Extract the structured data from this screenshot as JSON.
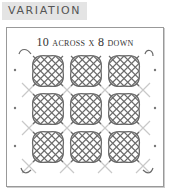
{
  "label": "VARIATION",
  "diagram": {
    "title": "10 across x 8 down",
    "grid": {
      "cols": 3,
      "rows": 3
    },
    "colors": {
      "motif": "#6a6a6a",
      "connector": "#c8c8c8",
      "dots": "#777777",
      "frame": "#999999"
    }
  }
}
